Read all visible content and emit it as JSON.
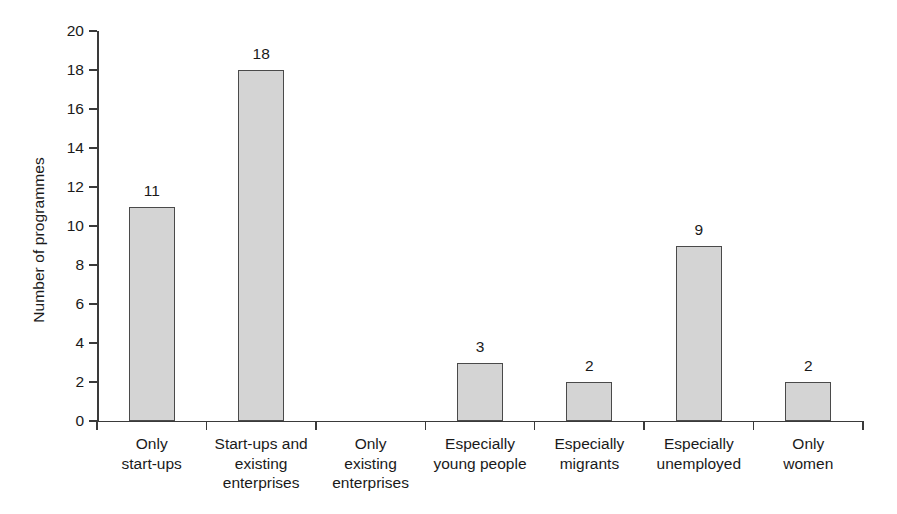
{
  "chart_data": {
    "type": "bar",
    "title": "",
    "subtitle": "",
    "xlabel": "",
    "ylabel": "Number of programmes",
    "ylim": [
      0,
      20
    ],
    "ytick_step": 2,
    "yticks": [
      "20",
      "18",
      "16",
      "14",
      "12",
      "10",
      "8",
      "6",
      "4",
      "2",
      "0"
    ],
    "grid": false,
    "legend": null,
    "categories": [
      "Only start-ups",
      "Start-ups and existing enterprises",
      "Only existing enterprises",
      "Especially young people",
      "Especially migrants",
      "Especially unemployed",
      "Only women"
    ],
    "category_lines": [
      [
        "Only",
        "start-ups"
      ],
      [
        "Start-ups and",
        "existing",
        "enterprises"
      ],
      [
        "Only",
        "existing",
        "enterprises"
      ],
      [
        "Especially",
        "young people"
      ],
      [
        "Especially",
        "migrants"
      ],
      [
        "Especially",
        "unemployed"
      ],
      [
        "Only",
        "women"
      ]
    ],
    "values": [
      11,
      18,
      0,
      3,
      2,
      9,
      2
    ],
    "value_labels": [
      "11",
      "18",
      "",
      "3",
      "2",
      "9",
      "2"
    ],
    "bar_fill_color": "#d4d4d4",
    "bar_border_color": "#4a4a4a",
    "axis_color": "#3a3a3a",
    "text_color": "#1a1a1a",
    "background_color": "#ffffff"
  }
}
